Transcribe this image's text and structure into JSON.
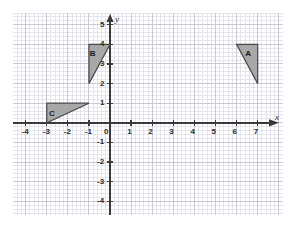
{
  "figure": {
    "title": "",
    "background_color": "#ffffff",
    "width": 295,
    "height": 229
  },
  "chart_data": {
    "type": "scatter",
    "title": "",
    "xlabel": "x",
    "ylabel": "y",
    "xlim": [
      -4.6,
      8.2
    ],
    "ylim": [
      -4.7,
      5.6
    ],
    "grid": true,
    "minor_grid": true,
    "minor_grid_step": 0.2,
    "major_grid_step": 1,
    "legend": "none",
    "origin_label": "0",
    "x_ticks": [
      -4,
      -3,
      -2,
      -1,
      1,
      2,
      3,
      4,
      5,
      6,
      7
    ],
    "x_tick_labels": [
      "-4",
      "-3",
      "-2",
      "-1",
      "1",
      "2",
      "3",
      "4",
      "5",
      "6",
      "7"
    ],
    "y_ticks": [
      5,
      4,
      3,
      2,
      1,
      -1,
      -2,
      -3,
      -4
    ],
    "y_tick_labels": [
      "5",
      "4",
      "3",
      "2",
      "1",
      "-1",
      "-2",
      "-3",
      "-4"
    ],
    "shapes": [
      {
        "label": "A",
        "type": "triangle",
        "vertices": [
          [
            6,
            4
          ],
          [
            7,
            4
          ],
          [
            7,
            2
          ]
        ],
        "label_position": [
          6.55,
          3.5
        ],
        "fill": "#a8a8a8",
        "stroke": "#4a4a4a"
      },
      {
        "label": "B",
        "type": "triangle",
        "vertices": [
          [
            -1,
            4
          ],
          [
            0,
            4
          ],
          [
            -1,
            2
          ]
        ],
        "label_position": [
          -0.82,
          3.5
        ],
        "fill": "#a8a8a8",
        "stroke": "#4a4a4a"
      },
      {
        "label": "C",
        "type": "triangle",
        "vertices": [
          [
            -3,
            1
          ],
          [
            -1,
            1
          ],
          [
            -3,
            0
          ]
        ],
        "label_position": [
          -2.75,
          0.45
        ],
        "fill": "#a8a8a8",
        "stroke": "#4a4a4a"
      }
    ],
    "colors": {
      "axis": "#3a3a3a",
      "major_grid": "#c9c9d2",
      "minor_grid": "#e4e4ec",
      "shape_fill": "#a8a8a8",
      "shape_stroke": "#4a4a4a",
      "text": "#2b2b2b"
    }
  }
}
